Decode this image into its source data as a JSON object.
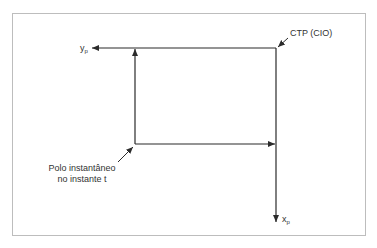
{
  "diagram": {
    "labels": {
      "ctp": "CTP (CIO)",
      "y_axis_main": "y",
      "y_axis_sub": "p",
      "x_axis_main": "x",
      "x_axis_sub": "p",
      "pole_line1": "Polo instantâneo",
      "pole_line2": "no instante t"
    },
    "colors": {
      "line": "#2b2b2b",
      "text": "#333333",
      "frame": "#bdbdbd"
    }
  }
}
